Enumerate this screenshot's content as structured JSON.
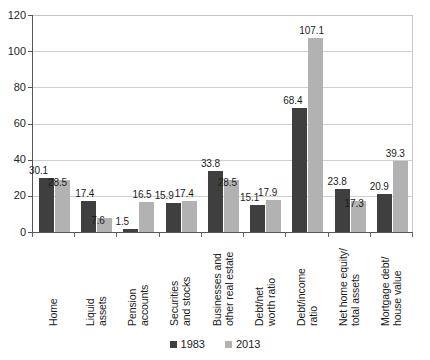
{
  "chart_data": {
    "type": "bar",
    "title": "",
    "subtitle": "",
    "xlabel": "",
    "ylabel": "",
    "ylim": [
      0,
      120
    ],
    "yticks": [
      0,
      20,
      40,
      60,
      80,
      100,
      120
    ],
    "grid": true,
    "legend_position": "bottom-center",
    "categories": [
      "Home",
      "Liquid\nassets",
      "Pension\naccounts",
      "Securities\nand stocks",
      "Businesses and\nother real estate",
      "Debt/net\nworth ratio",
      "Debt/income\nratio",
      "Net home equity/\ntotal assets",
      "Mortgage debt/\nhouse value"
    ],
    "series": [
      {
        "name": "1983",
        "color": "#3f3f3f",
        "values": [
          30.1,
          17.4,
          1.5,
          15.9,
          33.8,
          15.1,
          68.4,
          23.8,
          20.9
        ]
      },
      {
        "name": "2013",
        "color": "#b2b2b2",
        "values": [
          28.5,
          7.6,
          16.5,
          17.4,
          28.5,
          17.9,
          107.1,
          17.3,
          39.3
        ]
      }
    ],
    "data_labels": {
      "1983": [
        "30.1",
        "17.4",
        "1.5",
        "15.9",
        "33.8",
        "15.1",
        "68.4",
        "23.8",
        "20.9"
      ],
      "2013": [
        "28.5",
        "7.6",
        "16.5",
        "17.4",
        "28.5",
        "17.9",
        "107.1",
        "17.3",
        "39.3"
      ]
    }
  },
  "legend": {
    "items": [
      {
        "label": "1983",
        "color": "#3f3f3f"
      },
      {
        "label": "2013",
        "color": "#b2b2b2"
      }
    ]
  },
  "axis": {
    "y_tick_labels": [
      "120",
      "100",
      "80",
      "60",
      "40",
      "20",
      "0"
    ]
  }
}
